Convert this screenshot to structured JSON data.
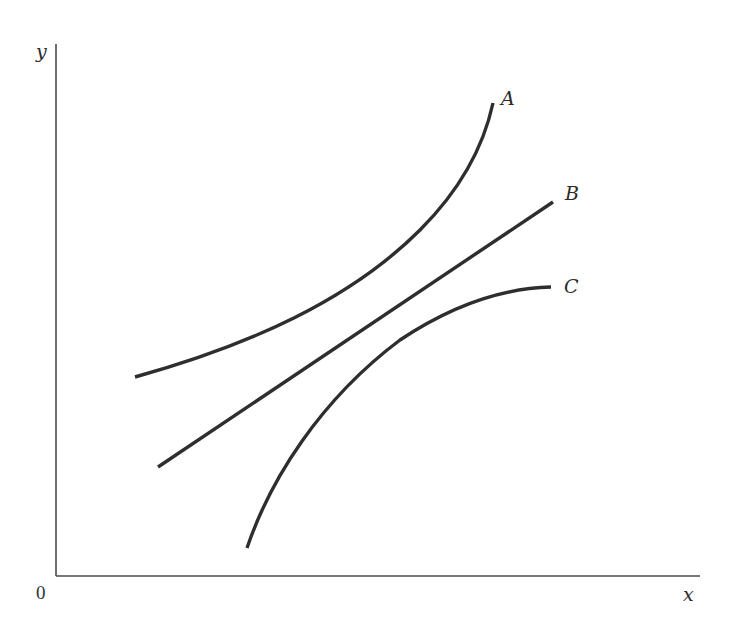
{
  "figure": {
    "axes": {
      "x_label": "x",
      "y_label": "y",
      "origin_label": "0"
    },
    "curves": [
      {
        "id": "A",
        "label": "A",
        "shape": "convex (increasing at an increasing rate)"
      },
      {
        "id": "B",
        "label": "B",
        "shape": "linear (constant slope)"
      },
      {
        "id": "C",
        "label": "C",
        "shape": "concave (increasing at a decreasing rate)"
      }
    ],
    "colors": {
      "line": "#2e2e2e",
      "axis": "#4a4a4a",
      "background": "#ffffff"
    }
  }
}
